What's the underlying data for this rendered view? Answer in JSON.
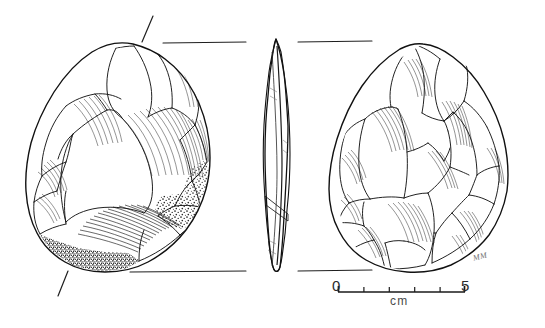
{
  "figure": {
    "background_color": "#ffffff",
    "ink_color": "#1a1a1a",
    "hatch_color": "#4a4a4a",
    "cortex_color": "#2a2a2a",
    "width": 545,
    "height": 328
  },
  "views": [
    {
      "id": "dorsal",
      "name": "Dorsal face view",
      "position": "left",
      "description": "Teardrop ovate biface, dorsal surface with invasive flake scars and cortex along the basal edge"
    },
    {
      "id": "profile",
      "name": "Profile section view",
      "position": "center",
      "description": "Narrow lenticular edge-on profile of the biface"
    },
    {
      "id": "ventral",
      "name": "Ventral face view",
      "position": "right",
      "description": "Opposite face of the biface with broad overlapping flake scars"
    }
  ],
  "registration": {
    "name": "orientation-guides",
    "top_line_label": "",
    "bottom_line_label": "",
    "tick_label": ""
  },
  "scale_bar": {
    "name": "scale-bar",
    "start_label": "0",
    "end_label": "5",
    "unit_label": "cm",
    "start_value": 0,
    "end_value": 5,
    "divisions": 5,
    "tick_values": [
      0,
      1,
      2,
      3,
      4,
      5
    ]
  },
  "credit": {
    "initials": "MM"
  }
}
